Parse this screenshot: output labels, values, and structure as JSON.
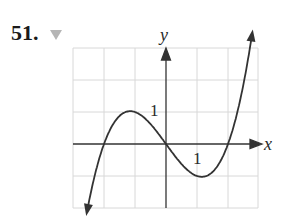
{
  "problem": {
    "number": "51.",
    "marker_icon": "triangle-down-icon"
  },
  "chart_data": {
    "type": "line",
    "title": "",
    "xlabel": "x",
    "ylabel": "y",
    "xlim": [
      -3,
      3
    ],
    "ylim": [
      -3,
      3
    ],
    "grid": true,
    "tick_labels": [
      {
        "axis": "y",
        "value": 1,
        "text": "1"
      },
      {
        "axis": "x",
        "value": 1,
        "text": "1"
      }
    ],
    "series": [
      {
        "name": "f(x)",
        "description": "cubic, zeros at -2, 0, 2; local max (-1, 1); local min (1, -1); arrows at both ends",
        "x": [
          -2.6,
          -2,
          -1.5,
          -1,
          -0.5,
          0,
          0.5,
          1,
          1.5,
          2,
          2.5,
          2.85
        ],
        "y": [
          -2.39,
          0,
          1.19,
          1,
          0.63,
          0,
          -0.63,
          -1,
          -0.94,
          0,
          1.88,
          3.1
        ]
      }
    ],
    "colors": {
      "curve": "#333333",
      "grid": "#d8d8d8",
      "axis": "#333333"
    }
  },
  "labels": {
    "x_axis": "x",
    "y_axis": "y",
    "y_tick": "1",
    "x_tick": "1"
  }
}
